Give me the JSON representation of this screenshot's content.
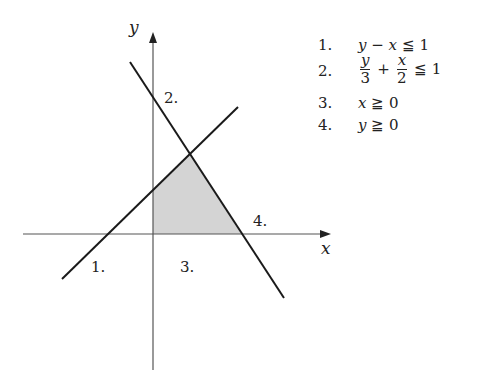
{
  "diagram": {
    "type": "linear-inequalities-feasible-region",
    "axes": {
      "x_label": "x",
      "y_label": "y"
    },
    "region_labels": [
      "1.",
      "2.",
      "3.",
      "4."
    ],
    "colors": {
      "line": "#1a1a1a",
      "axis": "#555555",
      "fill": "#d4d4d4"
    }
  },
  "labels": {
    "x_axis": "x",
    "y_axis": "y",
    "line1": "1.",
    "line2": "2.",
    "line3": "3.",
    "line4": "4."
  },
  "constraints": [
    {
      "num": "1.",
      "lhs": "y − x",
      "op": "≦",
      "rhs": "1"
    },
    {
      "num": "2.",
      "frac1_num": "y",
      "frac1_den": "3",
      "plus": "+",
      "frac2_num": "x",
      "frac2_den": "2",
      "op": "≦",
      "rhs": "1"
    },
    {
      "num": "3.",
      "lhs": "x",
      "op": "≧",
      "rhs": "0"
    },
    {
      "num": "4.",
      "lhs": "y",
      "op": "≧",
      "rhs": "0"
    }
  ]
}
